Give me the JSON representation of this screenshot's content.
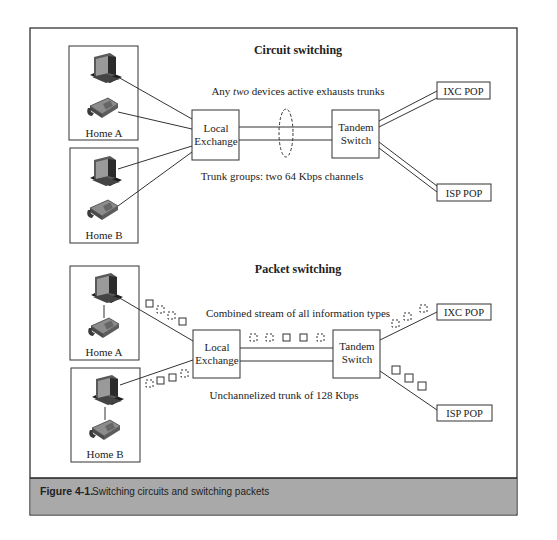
{
  "figure": {
    "label": "Figure 4-1.",
    "caption": "Switching circuits and switching packets",
    "caption_band_color": "#a9a9a9"
  },
  "circuit": {
    "title": "Circuit switching",
    "note_top_pre": "Any ",
    "note_top_em": "two",
    "note_top_post": " devices active exhausts trunks",
    "note_bottom": "Trunk groups: two 64 Kbps channels",
    "home_a": "Home A",
    "home_b": "Home B",
    "local_exchange_l1": "Local",
    "local_exchange_l2": "Exchange",
    "tandem_l1": "Tandem",
    "tandem_l2": "Switch",
    "ixc": "IXC POP",
    "isp": "ISP POP"
  },
  "packet": {
    "title": "Packet switching",
    "note_top": "Combined stream of all information types",
    "note_bottom": "Unchannelized trunk of 128 Kbps",
    "home_a": "Home A",
    "home_b": "Home B",
    "local_exchange_l1": "Local",
    "local_exchange_l2": "Exchange",
    "tandem_l1": "Tandem",
    "tandem_l2": "Switch",
    "ixc": "IXC POP",
    "isp": "ISP POP"
  }
}
